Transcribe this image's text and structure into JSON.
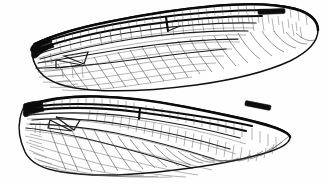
{
  "figure": {
    "subject": "Odonata wing venation",
    "background_color": "#fefefe",
    "ink_color": "#111111",
    "width": 328,
    "height": 184,
    "style": "scientific line drawing"
  },
  "wings": [
    {
      "id": "forewing",
      "label": "Forewing",
      "position": "upper",
      "base_x": 32,
      "base_y": 50,
      "tip_x": 318,
      "tip_y": 40,
      "outline_color": "#111111",
      "parts": {
        "pterostigma": {
          "label": "Pterostigma",
          "color": "#0d0d0d",
          "x": 258,
          "y": 10,
          "width": 27,
          "height": 5
        },
        "nodus": {
          "label": "Nodus",
          "x": 166,
          "y": 26
        },
        "discoidal_triangle": {
          "label": "Discoidal triangle",
          "x": 72,
          "y": 58
        },
        "costal_margin": {
          "label": "Costal margin"
        },
        "anal_margin": {
          "label": "Anal margin"
        }
      }
    },
    {
      "id": "hindwing",
      "label": "Hindwing",
      "position": "lower",
      "base_x": 24,
      "base_y": 112,
      "tip_x": 292,
      "tip_y": 126,
      "outline_color": "#111111",
      "parts": {
        "pterostigma": {
          "label": "Pterostigma",
          "color": "#0d0d0d",
          "x": 245,
          "y": 103,
          "width": 26,
          "height": 5
        },
        "nodus": {
          "label": "Nodus",
          "x": 140,
          "y": 97
        },
        "discoidal_triangle": {
          "label": "Discoidal triangle",
          "x": 66,
          "y": 120
        },
        "anal_lobe": {
          "label": "Anal lobe",
          "x": 60,
          "y": 165
        },
        "costal_margin": {
          "label": "Costal margin"
        },
        "anal_margin": {
          "label": "Anal margin"
        }
      }
    }
  ],
  "venation": {
    "description": "Dense reticulate network of polygonal cells",
    "cross_vein_color": "#3a3a3a",
    "fine_vein_color": "#4a4a4a",
    "main_vein_color": "#1a1a1a"
  }
}
